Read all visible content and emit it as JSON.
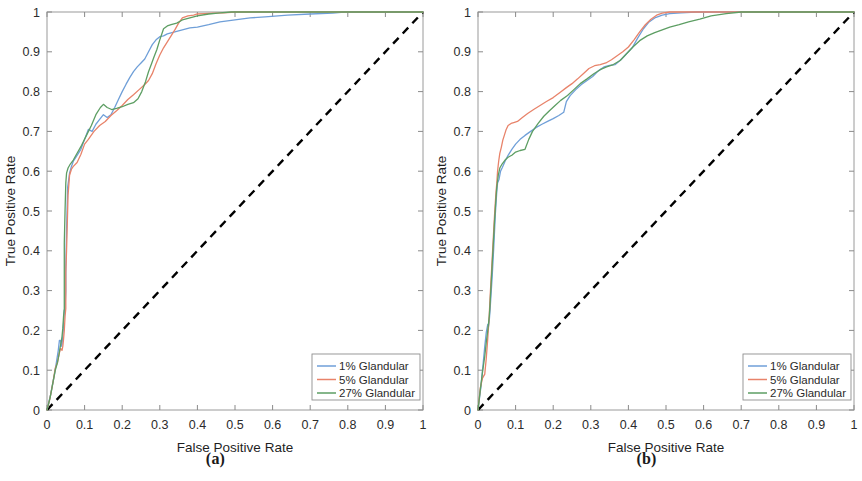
{
  "figure": {
    "background": "#ffffff",
    "panels": [
      {
        "caption": "(a)",
        "id": "a"
      },
      {
        "caption": "(b)",
        "id": "b"
      }
    ]
  },
  "chart_data": [
    {
      "type": "line",
      "panel": "(a)",
      "title": "",
      "xlabel": "False Positive Rate",
      "ylabel": "True Positive Rate",
      "xlim": [
        0,
        1
      ],
      "ylim": [
        0,
        1
      ],
      "xticks": [
        "0",
        "0.1",
        "0.2",
        "0.3",
        "0.4",
        "0.5",
        "0.6",
        "0.7",
        "0.8",
        "0.9",
        "1"
      ],
      "yticks": [
        "0",
        "0.1",
        "0.2",
        "0.3",
        "0.4",
        "0.5",
        "0.6",
        "0.7",
        "0.8",
        "0.9",
        "1"
      ],
      "grid": false,
      "legend_position": "lower right",
      "reference_line": {
        "name": "chance-diagonal",
        "style": "dashed",
        "color": "#000000",
        "x": [
          0,
          1
        ],
        "y": [
          0,
          1
        ]
      },
      "series": [
        {
          "name": "1% Glandular",
          "color": "#6f9fd8",
          "x": [
            0.0,
            0.01,
            0.02,
            0.025,
            0.03,
            0.033,
            0.036,
            0.038,
            0.04,
            0.042,
            0.044,
            0.046,
            0.048,
            0.05,
            0.05,
            0.052,
            0.055,
            0.06,
            0.065,
            0.07,
            0.08,
            0.09,
            0.1,
            0.11,
            0.12,
            0.13,
            0.14,
            0.15,
            0.16,
            0.17,
            0.18,
            0.19,
            0.2,
            0.21,
            0.22,
            0.23,
            0.24,
            0.25,
            0.26,
            0.27,
            0.28,
            0.29,
            0.3,
            0.31,
            0.32,
            0.34,
            0.36,
            0.38,
            0.4,
            0.43,
            0.46,
            0.5,
            0.54,
            0.58,
            0.64,
            0.7,
            0.76,
            0.79,
            0.85,
            1.0
          ],
          "y": [
            0.0,
            0.04,
            0.09,
            0.12,
            0.15,
            0.175,
            0.175,
            0.16,
            0.165,
            0.185,
            0.215,
            0.25,
            0.255,
            0.3,
            0.36,
            0.45,
            0.56,
            0.595,
            0.612,
            0.625,
            0.64,
            0.655,
            0.68,
            0.705,
            0.7,
            0.718,
            0.73,
            0.742,
            0.735,
            0.742,
            0.76,
            0.78,
            0.8,
            0.818,
            0.835,
            0.85,
            0.862,
            0.872,
            0.882,
            0.9,
            0.918,
            0.93,
            0.938,
            0.94,
            0.945,
            0.95,
            0.955,
            0.96,
            0.962,
            0.968,
            0.975,
            0.98,
            0.985,
            0.988,
            0.992,
            0.995,
            0.997,
            1.0,
            1.0,
            1.0
          ]
        },
        {
          "name": "5% Glandular",
          "color": "#e8836a",
          "x": [
            0.0,
            0.008,
            0.016,
            0.022,
            0.028,
            0.032,
            0.036,
            0.04,
            0.042,
            0.044,
            0.046,
            0.048,
            0.05,
            0.05,
            0.05,
            0.052,
            0.054,
            0.056,
            0.06,
            0.065,
            0.07,
            0.08,
            0.09,
            0.1,
            0.11,
            0.125,
            0.14,
            0.155,
            0.17,
            0.185,
            0.2,
            0.215,
            0.23,
            0.245,
            0.26,
            0.27,
            0.28,
            0.29,
            0.3,
            0.31,
            0.32,
            0.33,
            0.34,
            0.35,
            0.36,
            0.375,
            0.39,
            0.4,
            0.42,
            0.44,
            0.47,
            0.5,
            0.54,
            0.58,
            0.62,
            0.68,
            0.74,
            0.8,
            0.88,
            1.0
          ],
          "y": [
            0.0,
            0.03,
            0.07,
            0.105,
            0.12,
            0.14,
            0.155,
            0.15,
            0.16,
            0.178,
            0.2,
            0.235,
            0.255,
            0.3,
            0.345,
            0.4,
            0.47,
            0.54,
            0.59,
            0.605,
            0.612,
            0.622,
            0.642,
            0.668,
            0.68,
            0.7,
            0.715,
            0.725,
            0.74,
            0.752,
            0.765,
            0.78,
            0.792,
            0.805,
            0.818,
            0.828,
            0.845,
            0.87,
            0.892,
            0.91,
            0.925,
            0.94,
            0.955,
            0.972,
            0.985,
            0.99,
            0.992,
            0.995,
            0.996,
            0.997,
            0.998,
            1.0,
            1.0,
            1.0,
            1.0,
            1.0,
            1.0,
            1.0,
            1.0,
            1.0
          ]
        },
        {
          "name": "27% Glandular",
          "color": "#5d9e63",
          "x": [
            0.0,
            0.008,
            0.015,
            0.022,
            0.028,
            0.032,
            0.035,
            0.038,
            0.04,
            0.042,
            0.044,
            0.046,
            0.046,
            0.046,
            0.046,
            0.048,
            0.05,
            0.052,
            0.056,
            0.062,
            0.07,
            0.08,
            0.092,
            0.105,
            0.118,
            0.13,
            0.142,
            0.15,
            0.16,
            0.172,
            0.185,
            0.2,
            0.215,
            0.23,
            0.242,
            0.252,
            0.262,
            0.27,
            0.278,
            0.285,
            0.292,
            0.3,
            0.31,
            0.32,
            0.33,
            0.345,
            0.36,
            0.38,
            0.4,
            0.43,
            0.46,
            0.49,
            0.52,
            0.56,
            0.6,
            0.66,
            0.72,
            0.8,
            0.9,
            1.0
          ],
          "y": [
            0.0,
            0.03,
            0.065,
            0.1,
            0.12,
            0.14,
            0.158,
            0.172,
            0.185,
            0.205,
            0.235,
            0.255,
            0.3,
            0.35,
            0.42,
            0.5,
            0.57,
            0.595,
            0.608,
            0.618,
            0.628,
            0.645,
            0.665,
            0.69,
            0.715,
            0.742,
            0.76,
            0.768,
            0.76,
            0.755,
            0.758,
            0.762,
            0.768,
            0.772,
            0.782,
            0.8,
            0.825,
            0.85,
            0.87,
            0.888,
            0.905,
            0.93,
            0.958,
            0.965,
            0.968,
            0.972,
            0.98,
            0.985,
            0.99,
            0.995,
            0.998,
            1.0,
            1.0,
            1.0,
            1.0,
            1.0,
            1.0,
            1.0,
            1.0,
            1.0
          ]
        }
      ]
    },
    {
      "type": "line",
      "panel": "(b)",
      "title": "",
      "xlabel": "False Positive Rate",
      "ylabel": "True Positive Rate",
      "xlim": [
        0,
        1
      ],
      "ylim": [
        0,
        1
      ],
      "xticks": [
        "0",
        "0.1",
        "0.2",
        "0.3",
        "0.4",
        "0.5",
        "0.6",
        "0.7",
        "0.8",
        "0.9",
        "1"
      ],
      "yticks": [
        "0",
        "0.1",
        "0.2",
        "0.3",
        "0.4",
        "0.5",
        "0.6",
        "0.7",
        "0.8",
        "0.9",
        "1"
      ],
      "grid": false,
      "legend_position": "lower right",
      "reference_line": {
        "name": "chance-diagonal",
        "style": "dashed",
        "color": "#000000",
        "x": [
          0,
          1
        ],
        "y": [
          0,
          1
        ]
      },
      "series": [
        {
          "name": "1% Glandular",
          "color": "#6f9fd8",
          "x": [
            0.0,
            0.008,
            0.014,
            0.018,
            0.022,
            0.026,
            0.028,
            0.03,
            0.032,
            0.034,
            0.036,
            0.038,
            0.04,
            0.042,
            0.044,
            0.046,
            0.048,
            0.05,
            0.052,
            0.056,
            0.06,
            0.065,
            0.072,
            0.08,
            0.09,
            0.1,
            0.112,
            0.125,
            0.14,
            0.155,
            0.17,
            0.185,
            0.2,
            0.215,
            0.228,
            0.235,
            0.245,
            0.26,
            0.275,
            0.29,
            0.305,
            0.32,
            0.335,
            0.35,
            0.365,
            0.38,
            0.395,
            0.41,
            0.425,
            0.44,
            0.455,
            0.47,
            0.49,
            0.51,
            0.54,
            0.58,
            0.64,
            0.72,
            0.85,
            1.0
          ],
          "y": [
            0.0,
            0.06,
            0.12,
            0.16,
            0.195,
            0.215,
            0.21,
            0.225,
            0.25,
            0.28,
            0.31,
            0.34,
            0.375,
            0.41,
            0.45,
            0.49,
            0.52,
            0.55,
            0.57,
            0.58,
            0.6,
            0.61,
            0.625,
            0.64,
            0.655,
            0.668,
            0.68,
            0.69,
            0.7,
            0.71,
            0.718,
            0.725,
            0.732,
            0.74,
            0.748,
            0.775,
            0.79,
            0.805,
            0.818,
            0.828,
            0.838,
            0.852,
            0.862,
            0.866,
            0.868,
            0.88,
            0.895,
            0.91,
            0.935,
            0.958,
            0.975,
            0.985,
            0.992,
            0.996,
            0.998,
            1.0,
            1.0,
            1.0,
            1.0,
            1.0
          ]
        },
        {
          "name": "5% Glandular",
          "color": "#e8836a",
          "x": [
            0.0,
            0.006,
            0.012,
            0.018,
            0.022,
            0.026,
            0.03,
            0.032,
            0.034,
            0.036,
            0.038,
            0.04,
            0.042,
            0.044,
            0.046,
            0.048,
            0.05,
            0.052,
            0.055,
            0.058,
            0.062,
            0.066,
            0.07,
            0.075,
            0.08,
            0.088,
            0.095,
            0.105,
            0.118,
            0.132,
            0.148,
            0.165,
            0.182,
            0.2,
            0.218,
            0.235,
            0.25,
            0.265,
            0.28,
            0.295,
            0.31,
            0.325,
            0.34,
            0.355,
            0.37,
            0.385,
            0.4,
            0.415,
            0.43,
            0.445,
            0.46,
            0.475,
            0.49,
            0.51,
            0.54,
            0.58,
            0.65,
            0.74,
            0.87,
            1.0
          ],
          "y": [
            0.0,
            0.055,
            0.08,
            0.09,
            0.13,
            0.18,
            0.24,
            0.28,
            0.315,
            0.35,
            0.385,
            0.42,
            0.455,
            0.49,
            0.52,
            0.548,
            0.57,
            0.6,
            0.625,
            0.645,
            0.66,
            0.678,
            0.69,
            0.705,
            0.715,
            0.72,
            0.722,
            0.725,
            0.735,
            0.745,
            0.755,
            0.765,
            0.775,
            0.785,
            0.798,
            0.81,
            0.82,
            0.832,
            0.845,
            0.858,
            0.865,
            0.868,
            0.872,
            0.88,
            0.89,
            0.9,
            0.912,
            0.93,
            0.95,
            0.968,
            0.982,
            0.992,
            0.997,
            1.0,
            1.0,
            1.0,
            1.0,
            1.0,
            1.0,
            1.0
          ]
        },
        {
          "name": "27% Glandular",
          "color": "#5d9e63",
          "x": [
            0.0,
            0.006,
            0.012,
            0.018,
            0.022,
            0.026,
            0.03,
            0.032,
            0.034,
            0.036,
            0.038,
            0.04,
            0.042,
            0.044,
            0.046,
            0.048,
            0.05,
            0.054,
            0.058,
            0.064,
            0.072,
            0.08,
            0.09,
            0.1,
            0.112,
            0.125,
            0.135,
            0.145,
            0.16,
            0.175,
            0.19,
            0.205,
            0.22,
            0.238,
            0.255,
            0.272,
            0.29,
            0.308,
            0.325,
            0.342,
            0.36,
            0.378,
            0.395,
            0.412,
            0.43,
            0.45,
            0.47,
            0.49,
            0.51,
            0.535,
            0.56,
            0.59,
            0.62,
            0.66,
            0.7,
            0.75,
            0.8,
            0.86,
            0.93,
            1.0
          ],
          "y": [
            0.0,
            0.05,
            0.095,
            0.135,
            0.17,
            0.2,
            0.235,
            0.265,
            0.3,
            0.335,
            0.37,
            0.405,
            0.44,
            0.475,
            0.505,
            0.535,
            0.56,
            0.59,
            0.608,
            0.618,
            0.628,
            0.635,
            0.64,
            0.648,
            0.652,
            0.655,
            0.68,
            0.7,
            0.72,
            0.738,
            0.752,
            0.765,
            0.778,
            0.79,
            0.805,
            0.82,
            0.832,
            0.845,
            0.855,
            0.862,
            0.868,
            0.878,
            0.895,
            0.912,
            0.928,
            0.94,
            0.948,
            0.955,
            0.962,
            0.968,
            0.975,
            0.982,
            0.99,
            0.996,
            1.0,
            1.0,
            1.0,
            1.0,
            1.0,
            1.0
          ]
        }
      ]
    }
  ]
}
